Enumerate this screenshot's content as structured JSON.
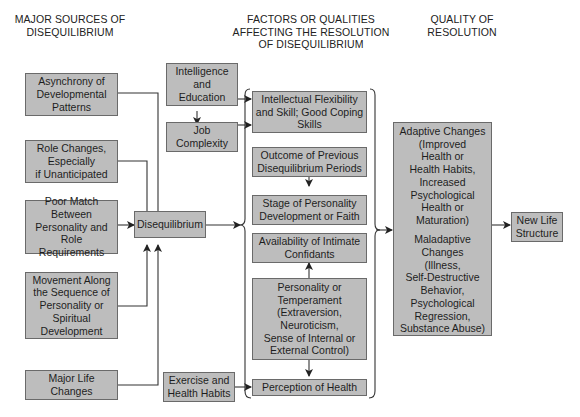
{
  "top_cut_text": "p(ege)y), ange ... ...",
  "headers": {
    "sources": "MAJOR SOURCES OF\nDISEQUILIBRIUM",
    "factors": "FACTORS OR QUALITIES\nAFFECTING THE RESOLUTION\nOF DISEQUILIBRIUM",
    "quality": "QUALITY OF\nRESOLUTION"
  },
  "sources": [
    "Asynchrony of\nDevelopmental\nPatterns",
    "Role Changes,\nEspecially\nif Unanticipated",
    "Poor Match\nBetween\nPersonality and\nRole Requirements",
    "Movement Along\nthe Sequence of\nPersonality or\nSpiritual\nDevelopment",
    "Major Life\nChanges"
  ],
  "center": "Disequilibrium",
  "external_factors": {
    "intelligence": "Intelligence\nand\nEducation",
    "job": "Job\nComplexity",
    "exercise": "Exercise and\nHealth Habits"
  },
  "factors": [
    "Intellectual Flexibility\nand Skill; Good Coping\nSkills",
    "Outcome of Previous\nDisequilibrium Periods",
    "Stage of Personality\nDevelopment or Faith",
    "Availability of Intimate\nConfidants",
    "Personality or\nTemperament\n(Extraversion,\nNeuroticism,\nSense of Internal or\nExternal Control)",
    "Perception of Health"
  ],
  "resolution": {
    "adaptive": "Adaptive Changes\n(Improved\nHealth or\nHealth Habits,\nIncreased\nPsychological\nHealth or Maturation)",
    "maladaptive": "Maladaptive\nChanges\n(Illness,\nSelf-Destructive\nBehavior,\nPsychological\nRegression,\nSubstance Abuse)"
  },
  "outcome": "New Life\nStructure",
  "colors": {
    "box_fill": "#bdbdbd",
    "box_border": "#6a6a6a",
    "line": "#333333"
  }
}
